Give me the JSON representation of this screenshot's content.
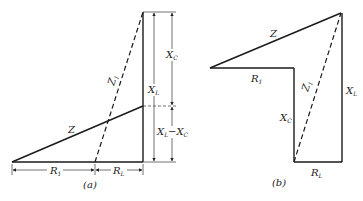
{
  "figure": {
    "panel_a": {
      "caption": "(a)",
      "labels": {
        "z": "Z",
        "z1": "Z",
        "z1_sub": "1",
        "r1": "R",
        "r1_sub": "1",
        "rl": "R",
        "rl_sub": "L",
        "xc": "X",
        "xc_sub": "C",
        "xl": "X",
        "xl_sub": "L",
        "xl_minus_xc": "X",
        "xl_minus_xc_sub1": "L",
        "xl_minus_xc_mid": "−X",
        "xl_minus_xc_sub2": "C"
      }
    },
    "panel_b": {
      "caption": "(b)",
      "labels": {
        "z": "Z",
        "z1": "Z",
        "z1_sub": "1",
        "r1": "R",
        "r1_sub": "1",
        "rl": "R",
        "rl_sub": "L",
        "xc": "X",
        "xc_sub": "C",
        "xl": "X",
        "xl_sub": "L"
      }
    }
  }
}
